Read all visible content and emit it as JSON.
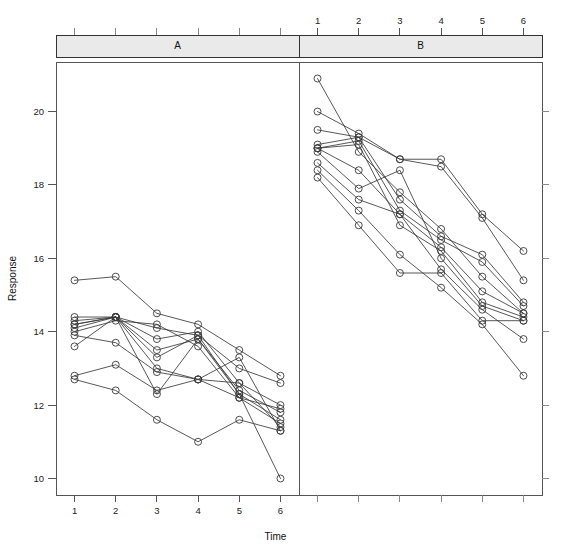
{
  "figure": {
    "width": 562,
    "height": 556,
    "background": "#ffffff",
    "foreground": "#333333"
  },
  "axes": {
    "y_title": "Response",
    "x_title": "Time",
    "y_ticks": [
      "10",
      "12",
      "14",
      "16",
      "18",
      "20"
    ],
    "x_ticks": [
      "1",
      "2",
      "3",
      "4",
      "5",
      "6"
    ]
  },
  "panels": [
    {
      "label": "A",
      "x_axis_position": "bottom"
    },
    {
      "label": "B",
      "x_axis_position": "top"
    }
  ],
  "chart_data": {
    "type": "line",
    "title": "",
    "xlabel": "Time",
    "ylabel": "Response",
    "x": [
      1,
      2,
      3,
      4,
      5,
      6
    ],
    "xlim": [
      0.55,
      6.45
    ],
    "ylim": [
      9.55,
      21.35
    ],
    "grid": false,
    "legend": "none",
    "marker": "open-circle",
    "layout": "trellis-two-panels-horizontal",
    "panels": [
      {
        "name": "A",
        "strip_label": "A",
        "x_tick_labels": [
          "1",
          "2",
          "3",
          "4",
          "5",
          "6"
        ],
        "series": [
          {
            "name": "A1",
            "values": [
              15.4,
              15.5,
              14.5,
              14.2,
              13.5,
              12.8
            ]
          },
          {
            "name": "A2",
            "values": [
              14.4,
              14.4,
              14.1,
              13.9,
              13.0,
              12.6
            ]
          },
          {
            "name": "A3",
            "values": [
              14.3,
              14.4,
              13.8,
              14.0,
              12.6,
              12.0
            ]
          },
          {
            "name": "A4",
            "values": [
              14.2,
              14.4,
              13.5,
              13.8,
              12.4,
              11.8
            ]
          },
          {
            "name": "A5",
            "values": [
              14.1,
              14.4,
              13.3,
              13.9,
              12.3,
              11.6
            ]
          },
          {
            "name": "A6",
            "values": [
              14.0,
              14.3,
              14.2,
              13.6,
              12.2,
              11.5
            ]
          },
          {
            "name": "A7",
            "values": [
              13.9,
              13.7,
              12.9,
              12.7,
              12.6,
              11.4
            ]
          },
          {
            "name": "A8",
            "values": [
              13.6,
              14.4,
              13.0,
              12.7,
              13.3,
              11.3
            ]
          },
          {
            "name": "A9",
            "values": [
              12.8,
              13.1,
              12.4,
              12.7,
              12.2,
              11.9
            ]
          },
          {
            "name": "A10",
            "values": [
              12.7,
              12.4,
              11.6,
              11.0,
              11.6,
              11.3
            ]
          },
          {
            "name": "A11",
            "values": [
              14.2,
              14.4,
              12.3,
              13.8,
              12.3,
              10.0
            ]
          }
        ]
      },
      {
        "name": "B",
        "strip_label": "B",
        "x_tick_labels": [
          "1",
          "2",
          "3",
          "4",
          "5",
          "6"
        ],
        "series": [
          {
            "name": "B1",
            "values": [
              20.9,
              18.9,
              17.8,
              16.8,
              15.5,
              14.5
            ]
          },
          {
            "name": "B2",
            "values": [
              20.0,
              19.4,
              18.7,
              18.7,
              17.2,
              16.2
            ]
          },
          {
            "name": "B3",
            "values": [
              19.5,
              19.3,
              18.7,
              18.5,
              17.1,
              15.4
            ]
          },
          {
            "name": "B4",
            "values": [
              19.1,
              19.3,
              17.6,
              16.6,
              16.1,
              14.8
            ]
          },
          {
            "name": "B5",
            "values": [
              19.0,
              19.2,
              17.3,
              16.5,
              15.9,
              14.7
            ]
          },
          {
            "name": "B6",
            "values": [
              19.0,
              18.4,
              17.2,
              16.3,
              15.1,
              14.5
            ]
          },
          {
            "name": "B7",
            "values": [
              19.0,
              19.1,
              16.9,
              16.2,
              14.8,
              14.4
            ]
          },
          {
            "name": "B8",
            "values": [
              18.9,
              17.9,
              18.4,
              16.0,
              14.7,
              14.3
            ]
          },
          {
            "name": "B9",
            "values": [
              18.6,
              17.6,
              17.2,
              15.7,
              14.6,
              13.8
            ]
          },
          {
            "name": "B10",
            "values": [
              18.4,
              17.3,
              16.1,
              15.2,
              14.2,
              12.8
            ]
          },
          {
            "name": "B11",
            "values": [
              18.2,
              16.9,
              15.6,
              15.6,
              14.3,
              14.3
            ]
          }
        ]
      }
    ]
  }
}
